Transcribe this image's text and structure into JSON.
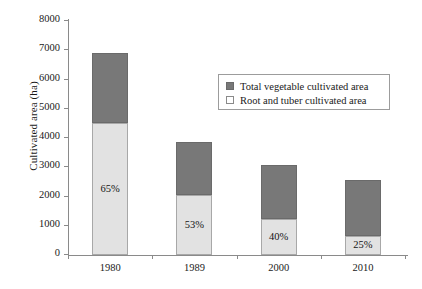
{
  "chart_data": {
    "type": "bar",
    "subtype": "stacked-bar",
    "title": "",
    "xlabel": "",
    "ylabel": "Cultivated area (ha)",
    "categories": [
      "1980",
      "1989",
      "2000",
      "2010"
    ],
    "ylim": [
      0,
      8000
    ],
    "yticks": [
      0,
      1000,
      2000,
      3000,
      4000,
      5000,
      6000,
      7000,
      8000
    ],
    "ytick_labels": [
      "0",
      "1000",
      "2000",
      "3000",
      "4000",
      "5000",
      "6000",
      "7000",
      "8000"
    ],
    "grid": false,
    "legend_position": "upper right",
    "series": [
      {
        "name": "Total vegetable cultivated area",
        "color": "#787878",
        "values": [
          2400,
          1810,
          1850,
          1920
        ]
      },
      {
        "name": "Root and tuber cultivated area",
        "color": "#e2e2e2",
        "values": [
          4500,
          2050,
          1230,
          650
        ]
      }
    ],
    "totals": [
      6900,
      3860,
      3080,
      2570
    ],
    "annotations": [
      {
        "text": "65%",
        "category": "1980"
      },
      {
        "text": "53%",
        "category": "1989"
      },
      {
        "text": "40%",
        "category": "2000"
      },
      {
        "text": "25%",
        "category": "2010"
      }
    ]
  },
  "legend": {
    "items": [
      {
        "label": "Total vegetable cultivated area",
        "swatch": "dark"
      },
      {
        "label": "Root and tuber cultivated area",
        "swatch": "light"
      }
    ]
  },
  "colors": {
    "dark_gray": "#787878",
    "light_gray": "#e2e2e2",
    "axis": "#8a8a8a",
    "background": "#ffffff"
  }
}
